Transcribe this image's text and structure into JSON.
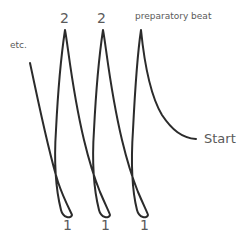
{
  "diagram": {
    "stroke_color": "#2b2b2b",
    "label_color": "#5a5a5a",
    "labels": {
      "etc": "etc.",
      "beat_2_a": "2",
      "beat_2_b": "2",
      "preparatory": "preparatory beat",
      "start": "Start",
      "beat_1_a": "1",
      "beat_1_b": "1",
      "beat_1_c": "1"
    }
  }
}
